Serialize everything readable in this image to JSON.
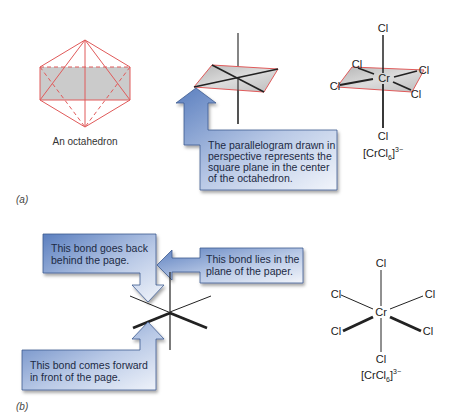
{
  "figure": {
    "panel_a": {
      "label": "(a)",
      "octahedron_caption": "An octahedron",
      "callout_text": [
        "The parallelogram drawn in",
        "perspective represents the",
        "square plane in the center",
        "of the octahedron."
      ],
      "complex": {
        "center": "Cr",
        "ligands": [
          "Cl",
          "Cl",
          "Cl",
          "Cl",
          "Cl",
          "Cl"
        ],
        "formula": {
          "base": "[CrCl",
          "sub": "6",
          "close": "]",
          "sup": "3−"
        }
      }
    },
    "panel_b": {
      "label": "(b)",
      "callouts": {
        "behind": [
          "This bond goes back",
          "behind the page."
        ],
        "plane": [
          "This bond lies in the",
          "plane of the paper."
        ],
        "forward": [
          "This bond comes forward",
          "in front of the page."
        ]
      },
      "complex": {
        "center": "Cr",
        "ligands": [
          "Cl",
          "Cl",
          "Cl",
          "Cl",
          "Cl",
          "Cl"
        ],
        "formula": {
          "base": "[CrCl",
          "sub": "6",
          "close": "]",
          "sup": "3−"
        }
      }
    },
    "colors": {
      "edge_red": "#e05a5a",
      "plane_gray": "#c8c8c8",
      "callout_blue_dark": "#4a6fb0",
      "callout_blue_light": "#e6ecf6",
      "bond": "#222222"
    }
  }
}
